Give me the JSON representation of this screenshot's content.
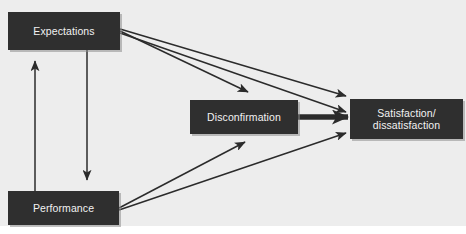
{
  "diagram": {
    "background_color": "#ededed",
    "page_color": "#ffffff",
    "node_fill": "#2f2f2f",
    "node_text_color": "#f2f2f2",
    "edge_color": "#2b2b2b",
    "nodes": [
      {
        "id": "expectations",
        "label": "Expectations"
      },
      {
        "id": "performance",
        "label": "Performance"
      },
      {
        "id": "disconfirmation",
        "label": "Disconfirmation"
      },
      {
        "id": "satisfaction",
        "label_line1": "Satisfaction/",
        "label_line2": "dissatisfaction"
      }
    ],
    "edges": [
      {
        "id": "performance-to-expectations",
        "from": "Performance",
        "to": "Expectations",
        "style": "thin",
        "direction": "up"
      },
      {
        "id": "expectations-to-performance",
        "from": "Expectations",
        "to": "Performance",
        "style": "thin",
        "direction": "down"
      },
      {
        "id": "expectations-to-disconfirmation",
        "from": "Expectations",
        "to": "Disconfirmation",
        "style": "thin",
        "direction": "right-down"
      },
      {
        "id": "expectations-to-satisfaction",
        "from": "Expectations",
        "to": "Satisfaction/dissatisfaction",
        "style": "thin",
        "direction": "right-down"
      },
      {
        "id": "performance-to-disconfirmation",
        "from": "Performance",
        "to": "Disconfirmation",
        "style": "thin",
        "direction": "right-up"
      },
      {
        "id": "performance-to-satisfaction",
        "from": "Performance",
        "to": "Satisfaction/dissatisfaction",
        "style": "thin",
        "direction": "right-up"
      },
      {
        "id": "disconfirmation-to-satisfaction",
        "from": "Disconfirmation",
        "to": "Satisfaction/dissatisfaction",
        "style": "thick",
        "direction": "right"
      }
    ]
  }
}
